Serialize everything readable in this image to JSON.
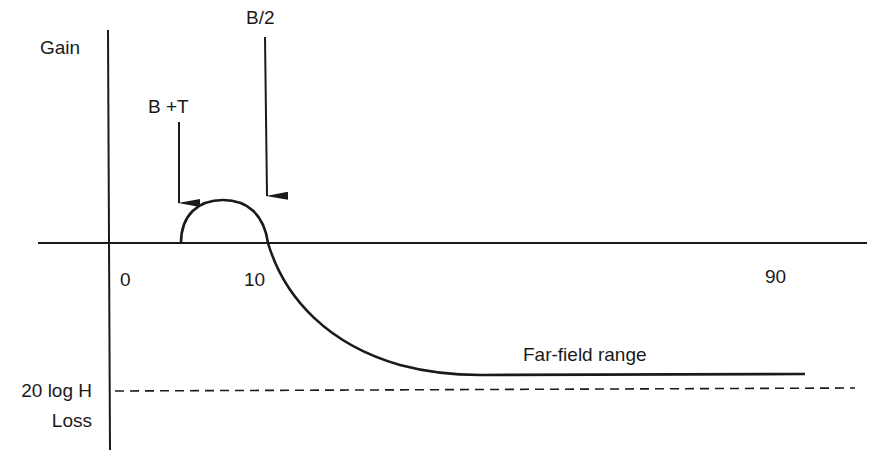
{
  "diagram": {
    "axis_labels": {
      "gain": "Gain",
      "loss": "Loss",
      "loss_level": "20 log H"
    },
    "markers": {
      "b_plus_t": "B +T",
      "b_half": "B/2"
    },
    "ticks": {
      "zero": "0",
      "ten": "10",
      "ninety": "90"
    },
    "annotations": {
      "far_field": "Far-field range"
    },
    "colors": {
      "ink": "#1a1a1a",
      "background": "#ffffff"
    }
  }
}
